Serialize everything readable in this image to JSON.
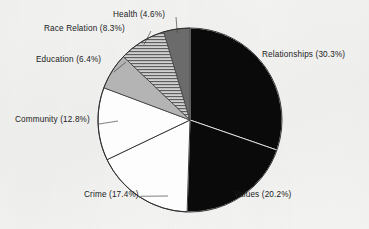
{
  "chart_data": {
    "type": "pie",
    "title": "",
    "subtitle": "",
    "xlabel": "",
    "ylabel": "",
    "legend_position": "none",
    "grid": false,
    "labels_show_percent": true,
    "start_angle_deg": 0,
    "direction": "clockwise",
    "categories": [
      "Relationships",
      "Values",
      "Crime",
      "Community",
      "Education",
      "Race Relation",
      "Health"
    ],
    "values": [
      30.3,
      20.2,
      17.4,
      12.8,
      6.4,
      8.3,
      4.6
    ],
    "units": "percent",
    "total": 100.0,
    "slices": [
      {
        "name": "Relationships",
        "value": 30.3,
        "label": "Relationships (30.3%)",
        "fill": "#0a0a0a",
        "pattern": "solid",
        "stroke": "#f2f2f2"
      },
      {
        "name": "Values",
        "value": 20.2,
        "label": "Values (20.2%)",
        "fill": "#0a0a0a",
        "pattern": "solid",
        "stroke": "#e8e8e8"
      },
      {
        "name": "Crime",
        "value": 17.4,
        "label": "Crime (17.4%)",
        "fill": "#fdfdfd",
        "pattern": "solid",
        "stroke": "#2a2a2a"
      },
      {
        "name": "Community",
        "value": 12.8,
        "label": "Community (12.8%)",
        "fill": "#fdfdfd",
        "pattern": "solid",
        "stroke": "#2a2a2a"
      },
      {
        "name": "Education",
        "value": 6.4,
        "label": "Education (6.4%)",
        "fill": "#b4b4b4",
        "pattern": "solid",
        "stroke": "#4a4a4a"
      },
      {
        "name": "Race Relation",
        "value": 8.3,
        "label": "Race Relation (8.3%)",
        "fill": "#c9c9c9",
        "pattern": "horizontal-hatch",
        "stroke": "#4a4a4a"
      },
      {
        "name": "Health",
        "value": 4.6,
        "label": "Health (4.6%)",
        "fill": "#6b6b6b",
        "pattern": "solid",
        "stroke": "#4a4a4a"
      }
    ],
    "colors": {
      "background": "#f7f7f6",
      "text": "#1b1b1b",
      "leader_line": "#3a3a3a"
    }
  }
}
